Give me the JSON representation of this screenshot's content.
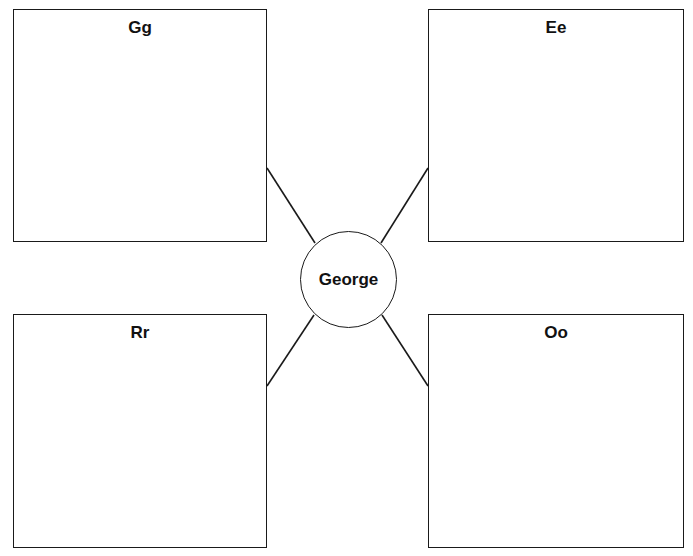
{
  "diagram": {
    "type": "web-organizer",
    "center": {
      "label": "George",
      "cx": 348,
      "cy": 279,
      "r": 48
    },
    "boxes": [
      {
        "id": "gg",
        "label": "Gg",
        "x": 13,
        "y": 9,
        "w": 254,
        "h": 233,
        "position": "top-left"
      },
      {
        "id": "ee",
        "label": "Ee",
        "x": 428,
        "y": 9,
        "w": 256,
        "h": 233,
        "position": "top-right"
      },
      {
        "id": "rr",
        "label": "Rr",
        "x": 13,
        "y": 314,
        "w": 254,
        "h": 234,
        "position": "bottom-left"
      },
      {
        "id": "oo",
        "label": "Oo",
        "x": 428,
        "y": 314,
        "w": 256,
        "h": 234,
        "position": "bottom-right"
      }
    ],
    "connectors": [
      {
        "from": "center",
        "to": "gg",
        "x1": 315,
        "y1": 243,
        "x2": 267,
        "y2": 168
      },
      {
        "from": "center",
        "to": "ee",
        "x1": 381,
        "y1": 243,
        "x2": 428,
        "y2": 168
      },
      {
        "from": "center",
        "to": "rr",
        "x1": 314,
        "y1": 315,
        "x2": 267,
        "y2": 386
      },
      {
        "from": "center",
        "to": "oo",
        "x1": 382,
        "y1": 315,
        "x2": 428,
        "y2": 386
      }
    ],
    "colors": {
      "stroke": "#1a1a1a",
      "background": "#ffffff",
      "text": "#111111"
    }
  }
}
